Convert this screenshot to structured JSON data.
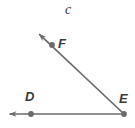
{
  "figure": {
    "type": "angle-diagram",
    "background_color": "#ffffff",
    "stroke_color": "#6b6b6b",
    "point_color": "#6b6b6b",
    "text_color": "#3a3a3a",
    "angle_label": {
      "name": "angle-name",
      "text": "c"
    },
    "points": [
      {
        "name": "F",
        "label": "F",
        "x": 52,
        "y": 45
      },
      {
        "name": "D",
        "label": "D",
        "x": 31,
        "y": 114
      },
      {
        "name": "E",
        "label": "E",
        "x": 124,
        "y": 114
      }
    ],
    "rays": [
      {
        "name": "ray-EF",
        "from": "E",
        "through": "F",
        "arrow_at": "F-end",
        "start": {
          "x": 124,
          "y": 114
        },
        "end": {
          "x": 38,
          "y": 33
        }
      },
      {
        "name": "ray-ED",
        "from": "E",
        "through": "D",
        "arrow_at": "D-end",
        "start": {
          "x": 124,
          "y": 114
        },
        "end": {
          "x": 8,
          "y": 114
        }
      }
    ]
  }
}
